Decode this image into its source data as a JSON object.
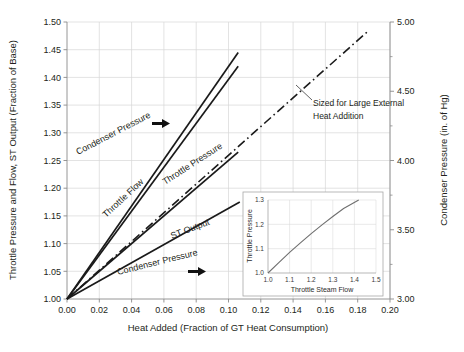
{
  "chart_data": {
    "type": "line",
    "title": "",
    "xlabel": "Heat Added (Fraction of GT Heat Consumption)",
    "ylabel": "Throttle Pressure and Flow, ST Output (Fraction of Base)",
    "y2label": "Condenser Pressure (in. of Hg)",
    "xlim": [
      0.0,
      0.2
    ],
    "ylim": [
      1.0,
      1.5
    ],
    "y2lim": [
      3.0,
      5.0
    ],
    "grid": true,
    "legend": "none (inline curve labels)",
    "xticks": [
      "0.00",
      "0.02",
      "0.04",
      "0.06",
      "0.08",
      "0.10",
      "0.12",
      "0.14",
      "0.16",
      "0.18",
      "0.20"
    ],
    "xtick_values": [
      0.0,
      0.02,
      0.04,
      0.06,
      0.08,
      0.1,
      0.12,
      0.14,
      0.16,
      0.18,
      0.2
    ],
    "yticks": [
      "1.00",
      "1.05",
      "1.10",
      "1.15",
      "1.20",
      "1.25",
      "1.30",
      "1.35",
      "1.40",
      "1.45",
      "1.50"
    ],
    "ytick_values": [
      1.0,
      1.05,
      1.1,
      1.15,
      1.2,
      1.25,
      1.3,
      1.35,
      1.4,
      1.45,
      1.5
    ],
    "y2ticks": [
      "3.00",
      "3.50",
      "4.00",
      "4.50",
      "5.00"
    ],
    "y2tick_values": [
      3.0,
      3.5,
      4.0,
      4.5,
      5.0
    ],
    "y2_minor_values": [
      3.25,
      3.75,
      4.25,
      4.75
    ],
    "series": [
      {
        "name": "Condenser Pressure (upper, left-axis scaled)",
        "label": "Condenser Pressure",
        "style": "solid",
        "axis": "left",
        "x": [
          0.0,
          0.106
        ],
        "values": [
          1.0,
          1.445
        ]
      },
      {
        "name": "Throttle Flow",
        "label": "Throttle Flow",
        "style": "solid",
        "axis": "left",
        "x": [
          0.0,
          0.106
        ],
        "values": [
          1.0,
          1.42
        ]
      },
      {
        "name": "Throttle Pressure",
        "label": "Throttle Pressure",
        "style": "solid",
        "axis": "left",
        "x": [
          0.0,
          0.106
        ],
        "values": [
          1.0,
          1.265
        ]
      },
      {
        "name": "ST Output",
        "label": "ST Output",
        "style": "solid",
        "axis": "left",
        "x": [
          0.0,
          0.107
        ],
        "values": [
          1.0,
          1.175
        ]
      },
      {
        "name": "Condenser Pressure (lower, right-axis)",
        "label": "Condenser Pressure",
        "style": "dash-dot",
        "axis": "right",
        "x": [
          0.0,
          0.186
        ],
        "values": [
          3.0,
          4.93
        ]
      }
    ],
    "annotations": [
      {
        "text_line1": "Sized for Large External",
        "text_line2": "Heat Addition",
        "target_x": 0.118,
        "target_y2": 4.12
      },
      {
        "name": "arrow-upper",
        "glyph": "right-arrow"
      },
      {
        "name": "arrow-lower",
        "glyph": "right-arrow"
      }
    ],
    "inset": {
      "type": "line",
      "xlabel": "Throttle Steam Flow",
      "ylabel": "Throttle Pressure",
      "xlim": [
        1.0,
        1.5
      ],
      "ylim": [
        1.0,
        1.3
      ],
      "xticks": [
        "1.0",
        "1.1",
        "1.2",
        "1.3",
        "1.4",
        "1.5"
      ],
      "xtick_values": [
        1.0,
        1.1,
        1.2,
        1.3,
        1.4,
        1.5
      ],
      "yticks": [
        "1.0",
        "1.1",
        "1.2",
        "1.3"
      ],
      "ytick_values": [
        1.0,
        1.1,
        1.2,
        1.3
      ],
      "grid": true,
      "x": [
        1.0,
        1.05,
        1.1,
        1.15,
        1.2,
        1.25,
        1.3,
        1.35,
        1.42
      ],
      "values": [
        1.0,
        1.043,
        1.085,
        1.124,
        1.162,
        1.198,
        1.232,
        1.265,
        1.3
      ]
    }
  },
  "style": {
    "line_color": "#1a1a1a",
    "grid_color": "#d7d7d7",
    "axis_color": "#808080",
    "inset_line_color": "#6f6f6f",
    "inset_border_color": "#9a9a9a",
    "background": "#ffffff"
  }
}
